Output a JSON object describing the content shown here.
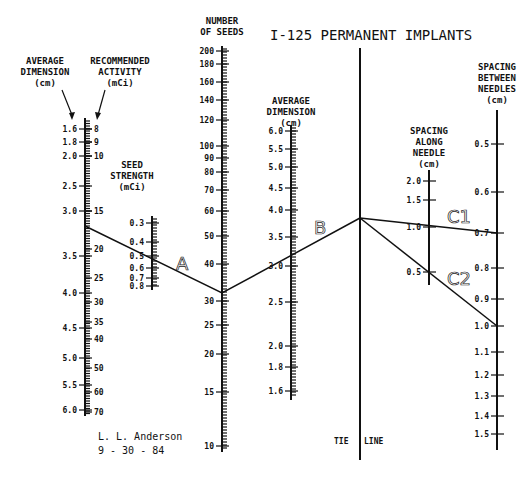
{
  "title": "I-125 PERMANENT IMPLANTS",
  "signature": {
    "author": "L. L. Anderson",
    "date": "9 - 30 - 84"
  },
  "tie_line_label": {
    "left": "TIE",
    "right": "LINE"
  },
  "route_labels": {
    "a": "A",
    "b": "B",
    "c1": "C1",
    "c2": "C2"
  },
  "scales": {
    "avg_dim_1": {
      "header": [
        "AVERAGE",
        "DIMENSION",
        "(cm)"
      ],
      "ticks": [
        {
          "label": "1.6",
          "y": 129
        },
        {
          "label": "1.8",
          "y": 142
        },
        {
          "label": "2.0",
          "y": 156
        },
        {
          "label": "2.5",
          "y": 186
        },
        {
          "label": "3.0",
          "y": 211
        },
        {
          "label": "3.5",
          "y": 256
        },
        {
          "label": "4.0",
          "y": 293
        },
        {
          "label": "4.5",
          "y": 328
        },
        {
          "label": "5.0",
          "y": 358
        },
        {
          "label": "5.5",
          "y": 385
        },
        {
          "label": "6.0",
          "y": 410
        }
      ]
    },
    "rec_activity": {
      "header": [
        "RECOMMENDED",
        "ACTIVITY",
        "(mCi)"
      ],
      "ticks": [
        {
          "label": "8",
          "y": 129
        },
        {
          "label": "9",
          "y": 142
        },
        {
          "label": "10",
          "y": 156
        },
        {
          "label": "15",
          "y": 211
        },
        {
          "label": "20",
          "y": 249
        },
        {
          "label": "25",
          "y": 278
        },
        {
          "label": "30",
          "y": 302
        },
        {
          "label": "35",
          "y": 322
        },
        {
          "label": "40",
          "y": 339
        },
        {
          "label": "50",
          "y": 368
        },
        {
          "label": "60",
          "y": 392
        },
        {
          "label": "70",
          "y": 412
        }
      ]
    },
    "seed_strength": {
      "header": [
        "SEED",
        "STRENGTH",
        "(mCi)"
      ],
      "ticks": [
        {
          "label": "0.3",
          "y": 223
        },
        {
          "label": "0.4",
          "y": 242
        },
        {
          "label": "0.5",
          "y": 256
        },
        {
          "label": "0.6",
          "y": 268
        },
        {
          "label": "0.7",
          "y": 278
        },
        {
          "label": "0.8",
          "y": 286
        }
      ]
    },
    "num_seeds": {
      "header": [
        "NUMBER",
        "OF SEEDS"
      ],
      "ticks": [
        {
          "label": "200",
          "y": 51
        },
        {
          "label": "180",
          "y": 64
        },
        {
          "label": "160",
          "y": 82
        },
        {
          "label": "140",
          "y": 100
        },
        {
          "label": "120",
          "y": 120
        },
        {
          "label": "100",
          "y": 146
        },
        {
          "label": "90",
          "y": 158
        },
        {
          "label": "80",
          "y": 172
        },
        {
          "label": "70",
          "y": 190
        },
        {
          "label": "60",
          "y": 211
        },
        {
          "label": "50",
          "y": 236
        },
        {
          "label": "40",
          "y": 264
        },
        {
          "label": "30",
          "y": 301
        },
        {
          "label": "25",
          "y": 325
        },
        {
          "label": "20",
          "y": 354
        },
        {
          "label": "15",
          "y": 392
        },
        {
          "label": "10",
          "y": 446
        }
      ]
    },
    "avg_dim_2": {
      "header": [
        "AVERAGE",
        "DIMENSION",
        "(cm)"
      ],
      "ticks": [
        {
          "label": "6.0",
          "y": 131
        },
        {
          "label": "5.5",
          "y": 149
        },
        {
          "label": "5.0",
          "y": 167
        },
        {
          "label": "4.5",
          "y": 188
        },
        {
          "label": "4.0",
          "y": 210
        },
        {
          "label": "3.5",
          "y": 237
        },
        {
          "label": "3.0",
          "y": 266
        },
        {
          "label": "2.5",
          "y": 302
        },
        {
          "label": "2.0",
          "y": 346
        },
        {
          "label": "1.8",
          "y": 367
        },
        {
          "label": "1.6",
          "y": 391
        }
      ]
    },
    "spacing_along": {
      "header": [
        "SPACING",
        "ALONG",
        "NEEDLE",
        "(cm)"
      ],
      "ticks": [
        {
          "label": "2.0",
          "y": 181
        },
        {
          "label": "1.5",
          "y": 200
        },
        {
          "label": "1.0",
          "y": 227
        },
        {
          "label": "0.5",
          "y": 272
        }
      ]
    },
    "spacing_between": {
      "header": [
        "SPACING",
        "BETWEEN",
        "NEEDLES",
        "(cm)"
      ],
      "ticks": [
        {
          "label": "0.5",
          "y": 144
        },
        {
          "label": "0.6",
          "y": 192
        },
        {
          "label": "0.7",
          "y": 233
        },
        {
          "label": "0.8",
          "y": 268
        },
        {
          "label": "0.9",
          "y": 299
        },
        {
          "label": "1.0",
          "y": 326
        },
        {
          "label": "1.1",
          "y": 352
        },
        {
          "label": "1.2",
          "y": 375
        },
        {
          "label": "1.3",
          "y": 396
        },
        {
          "label": "1.4",
          "y": 416
        },
        {
          "label": "1.5",
          "y": 434
        }
      ]
    }
  }
}
